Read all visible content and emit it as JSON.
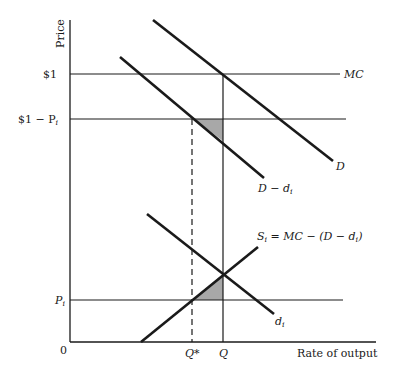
{
  "diagram": {
    "type": "supply-demand",
    "axes": {
      "y_label": "Price",
      "x_label": "Rate of output",
      "origin": "0"
    },
    "price_levels": {
      "one_dollar": "$1",
      "one_minus_pi": "$1 − P",
      "one_minus_pi_sub": "i",
      "pi": "P",
      "pi_sub": "i"
    },
    "quantity_levels": {
      "q_star": "Q*",
      "q": "Q"
    },
    "curves": {
      "mc": "MC",
      "d": "D",
      "d_minus_di": "D − d",
      "d_minus_di_sub": "i",
      "di": "d",
      "di_sub": "i",
      "si_lhs": "S",
      "si_lhs_sub": "i",
      "si_rhs": " = MC − (D − d",
      "si_rhs_sub": "i",
      "si_close": ")"
    },
    "colors": {
      "line": "#1a1a1a",
      "shade": "#a8a8a8"
    }
  }
}
